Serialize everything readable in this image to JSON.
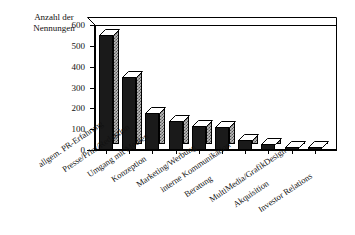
{
  "chart_data": {
    "type": "bar",
    "title": "",
    "ylabel": "Anzahl der Nennungen",
    "xlabel": "",
    "ylim": [
      0,
      600
    ],
    "yticks": [
      0,
      100,
      200,
      300,
      400,
      500,
      600
    ],
    "ytick_labels": [
      "0",
      "100",
      "200",
      "300",
      "400",
      "500",
      "600"
    ],
    "grid": false,
    "legend": "none",
    "style": "3d-column",
    "categories": [
      "allgem. PR-Erfahrung",
      "Presse/Print/Redaktion",
      "Umgang mit Medien",
      "Konzeption",
      "Marketing/Werbung",
      "interne Kommunikation",
      "Beratung",
      "MultiMedia/GrafikDesign",
      "Akquisition",
      "Investor Relations"
    ],
    "values": [
      550,
      350,
      180,
      140,
      115,
      110,
      50,
      30,
      10,
      10
    ],
    "bar_colors": {
      "front": "#1a1a1a",
      "side": "#bdbdbd",
      "top": "#ffffff"
    }
  },
  "axis": {
    "y_title_line1": "Anzahl der",
    "y_title_line2": "Nennungen"
  }
}
